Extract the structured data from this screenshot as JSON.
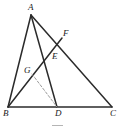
{
  "figure": {
    "type": "euclidean-geometry-diagram",
    "width": 120,
    "height": 132,
    "background_color": "#ffffff",
    "stroke_color": "#2b2b2b",
    "dashed_stroke_color": "#9a9a9a",
    "label_color": "#1a1a1a"
  },
  "points": {
    "A": {
      "label": "A",
      "x": 31,
      "y": 15,
      "label_x": 28,
      "label_y": 3
    },
    "B": {
      "label": "B",
      "x": 8,
      "y": 107,
      "label_x": 3,
      "label_y": 109
    },
    "C": {
      "label": "C",
      "x": 112,
      "y": 107,
      "label_x": 110,
      "label_y": 109
    },
    "D": {
      "label": "D",
      "x": 57,
      "y": 107,
      "label_x": 55,
      "label_y": 109
    },
    "E": {
      "label": "E",
      "x": 50,
      "y": 56,
      "label_x": 52,
      "label_y": 52
    },
    "F": {
      "label": "F",
      "x": 62,
      "y": 38,
      "label_x": 63,
      "label_y": 29
    },
    "G": {
      "label": "G",
      "x": 32,
      "y": 74,
      "label_x": 24,
      "label_y": 66
    }
  },
  "segments": [
    {
      "name": "segment-AB",
      "from": "A",
      "to": "B",
      "style": "solid"
    },
    {
      "name": "segment-BC",
      "from": "B",
      "to": "C",
      "style": "solid"
    },
    {
      "name": "segment-AC",
      "from": "A",
      "to": "C",
      "style": "solid"
    },
    {
      "name": "segment-AD",
      "from": "A",
      "to": "D",
      "style": "solid"
    },
    {
      "name": "segment-BF",
      "from": "B",
      "to": "F",
      "style": "solid"
    },
    {
      "name": "segment-GD",
      "from": "G",
      "to": "D",
      "style": "dashed"
    }
  ],
  "caption_mark": {
    "name": "caption-rule",
    "x": 52,
    "y": 125,
    "width": 11,
    "height": 1,
    "color": "#b5b5b5"
  }
}
